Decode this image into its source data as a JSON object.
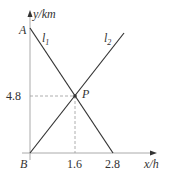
{
  "axes": {
    "y_label": "y/km",
    "x_label": "x/h"
  },
  "points": {
    "A": "A",
    "B": "B",
    "P": "P"
  },
  "lines": {
    "l1": {
      "name": "l",
      "sub": "1"
    },
    "l2": {
      "name": "l",
      "sub": "2"
    }
  },
  "ticks": {
    "y_mark": "4.8",
    "x_mark_1": "1.6",
    "x_mark_2": "2.8"
  },
  "colors": {
    "axis": "#aaaaaa",
    "line": "#333333",
    "dash": "#999999"
  }
}
